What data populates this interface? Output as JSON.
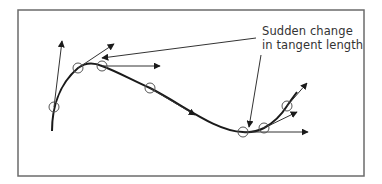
{
  "diagram": {
    "frame": {
      "x": 18,
      "y": 10,
      "width": 346,
      "height": 166,
      "stroke": "#6b6b6b"
    },
    "annotation": {
      "line1": "Sudden change",
      "line2": "in tangent length"
    },
    "colors": {
      "curve": "#1a1a1a",
      "tangent": "#333333",
      "marker": "#555555",
      "text": "#333333"
    },
    "curve_points": [
      {
        "x": 52,
        "y": 131
      },
      {
        "x": 54,
        "y": 107
      },
      {
        "x": 78,
        "y": 68
      },
      {
        "x": 102,
        "y": 66
      },
      {
        "x": 150,
        "y": 88
      },
      {
        "x": 243,
        "y": 132
      },
      {
        "x": 264,
        "y": 128
      },
      {
        "x": 287,
        "y": 106
      },
      {
        "x": 297,
        "y": 92
      }
    ],
    "markers": [
      {
        "x": 54,
        "y": 107
      },
      {
        "x": 78,
        "y": 68
      },
      {
        "x": 102,
        "y": 66
      },
      {
        "x": 150,
        "y": 88
      },
      {
        "x": 243,
        "y": 132
      },
      {
        "x": 264,
        "y": 128
      },
      {
        "x": 287,
        "y": 106
      }
    ],
    "tangents": [
      {
        "from": [
          54,
          107
        ],
        "to": [
          62,
          41
        ]
      },
      {
        "from": [
          78,
          68
        ],
        "to": [
          114,
          44
        ]
      },
      {
        "from": [
          102,
          66
        ],
        "to": [
          160,
          66
        ]
      },
      {
        "from": [
          150,
          88
        ],
        "to": [
          195,
          115
        ]
      },
      {
        "from": [
          243,
          132
        ],
        "to": [
          308,
          132
        ]
      },
      {
        "from": [
          264,
          128
        ],
        "to": [
          297,
          112
        ]
      },
      {
        "from": [
          287,
          106
        ],
        "to": [
          307,
          83
        ]
      }
    ],
    "annotation_pointers": [
      {
        "from": [
          256,
          38
        ],
        "to": [
          102,
          58
        ]
      },
      {
        "from": [
          261,
          55
        ],
        "to": [
          249,
          127
        ]
      }
    ]
  }
}
